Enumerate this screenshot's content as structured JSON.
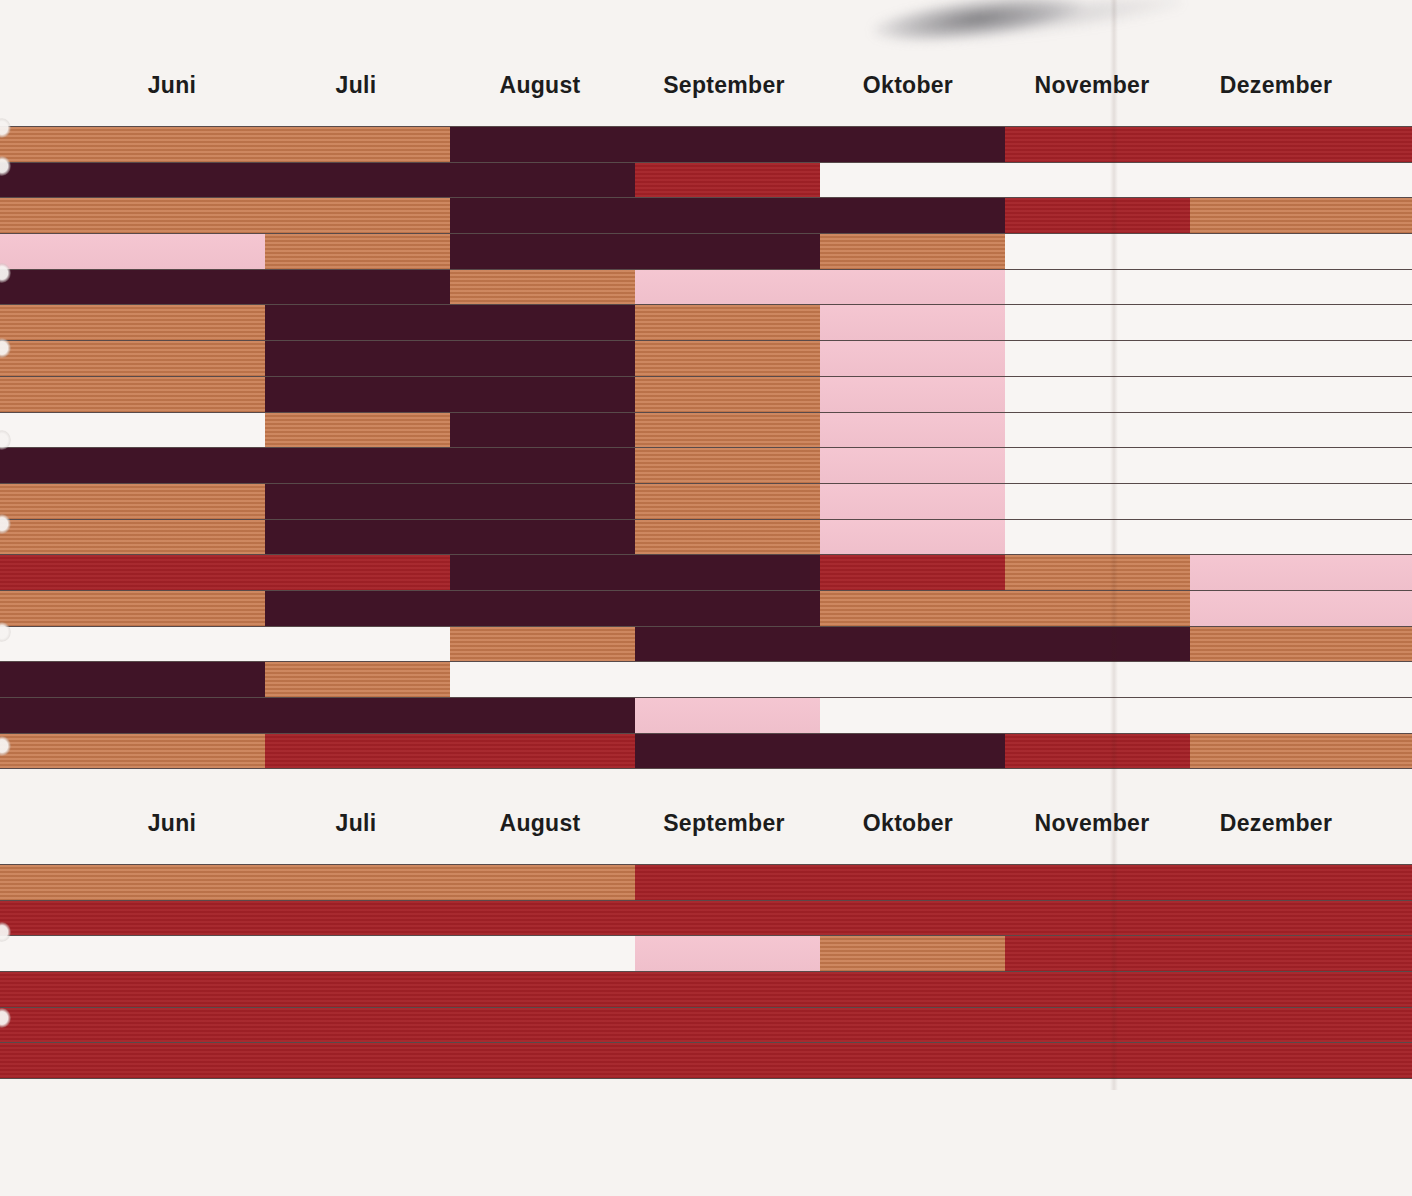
{
  "chart_data": {
    "type": "heatmap",
    "subtype": "seasonal-timeline-bars",
    "x_categories": [
      "Juni",
      "Juli",
      "August",
      "September",
      "Oktober",
      "November",
      "Dezember"
    ],
    "legend_position": "none",
    "grid": "row-separator-lines",
    "colors": {
      "o": "#c87a4e",
      "d": "#401427",
      "r": "#a42127",
      "p": "#f4c3cf",
      "w": "#f8f5f3"
    },
    "color_names": {
      "o": "orange",
      "d": "dark-maroon",
      "r": "red",
      "p": "pink",
      "w": "white"
    },
    "panels": [
      {
        "rows": [
          [
            {
              "c": "o",
              "w": 31.9
            },
            {
              "c": "d",
              "w": 39.3
            },
            {
              "c": "r",
              "w": 28.8
            }
          ],
          [
            {
              "c": "d",
              "w": 45.0
            },
            {
              "c": "r",
              "w": 13.1
            },
            {
              "c": "w",
              "w": 41.9
            }
          ],
          [
            {
              "c": "o",
              "w": 31.9
            },
            {
              "c": "d",
              "w": 39.3
            },
            {
              "c": "r",
              "w": 13.1
            },
            {
              "c": "o",
              "w": 15.7
            }
          ],
          [
            {
              "c": "p",
              "w": 18.8
            },
            {
              "c": "o",
              "w": 13.1
            },
            {
              "c": "d",
              "w": 26.2
            },
            {
              "c": "o",
              "w": 13.1
            },
            {
              "c": "w",
              "w": 28.8
            }
          ],
          [
            {
              "c": "d",
              "w": 31.9
            },
            {
              "c": "o",
              "w": 13.1
            },
            {
              "c": "p",
              "w": 26.2
            },
            {
              "c": "w",
              "w": 28.8
            }
          ],
          [
            {
              "c": "o",
              "w": 18.8
            },
            {
              "c": "d",
              "w": 26.2
            },
            {
              "c": "o",
              "w": 13.1
            },
            {
              "c": "p",
              "w": 13.1
            },
            {
              "c": "w",
              "w": 28.8
            }
          ],
          [
            {
              "c": "o",
              "w": 18.8
            },
            {
              "c": "d",
              "w": 26.2
            },
            {
              "c": "o",
              "w": 13.1
            },
            {
              "c": "p",
              "w": 13.1
            },
            {
              "c": "w",
              "w": 28.8
            }
          ],
          [
            {
              "c": "o",
              "w": 18.8
            },
            {
              "c": "d",
              "w": 26.2
            },
            {
              "c": "o",
              "w": 13.1
            },
            {
              "c": "p",
              "w": 13.1
            },
            {
              "c": "w",
              "w": 28.8
            }
          ],
          [
            {
              "c": "w",
              "w": 18.8
            },
            {
              "c": "o",
              "w": 13.1
            },
            {
              "c": "d",
              "w": 13.1
            },
            {
              "c": "o",
              "w": 13.1
            },
            {
              "c": "p",
              "w": 13.1
            },
            {
              "c": "w",
              "w": 28.8
            }
          ],
          [
            {
              "c": "d",
              "w": 45.0
            },
            {
              "c": "o",
              "w": 13.1
            },
            {
              "c": "p",
              "w": 13.1
            },
            {
              "c": "w",
              "w": 28.8
            }
          ],
          [
            {
              "c": "o",
              "w": 18.8
            },
            {
              "c": "d",
              "w": 26.2
            },
            {
              "c": "o",
              "w": 13.1
            },
            {
              "c": "p",
              "w": 13.1
            },
            {
              "c": "w",
              "w": 28.8
            }
          ],
          [
            {
              "c": "o",
              "w": 18.8
            },
            {
              "c": "d",
              "w": 26.2
            },
            {
              "c": "o",
              "w": 13.1
            },
            {
              "c": "p",
              "w": 13.1
            },
            {
              "c": "w",
              "w": 28.8
            }
          ],
          [
            {
              "c": "r",
              "w": 31.9
            },
            {
              "c": "d",
              "w": 26.2
            },
            {
              "c": "r",
              "w": 13.1
            },
            {
              "c": "o",
              "w": 13.1
            },
            {
              "c": "p",
              "w": 15.7
            }
          ],
          [
            {
              "c": "o",
              "w": 18.8
            },
            {
              "c": "d",
              "w": 39.3
            },
            {
              "c": "o",
              "w": 26.2
            },
            {
              "c": "p",
              "w": 15.7
            }
          ],
          [
            {
              "c": "w",
              "w": 31.9
            },
            {
              "c": "o",
              "w": 13.1
            },
            {
              "c": "d",
              "w": 39.3
            },
            {
              "c": "o",
              "w": 15.7
            }
          ],
          [
            {
              "c": "d",
              "w": 18.8
            },
            {
              "c": "o",
              "w": 13.1
            },
            {
              "c": "w",
              "w": 68.1
            }
          ],
          [
            {
              "c": "d",
              "w": 45.0
            },
            {
              "c": "p",
              "w": 13.1
            },
            {
              "c": "w",
              "w": 41.9
            }
          ],
          [
            {
              "c": "o",
              "w": 18.8
            },
            {
              "c": "r",
              "w": 26.2
            },
            {
              "c": "d",
              "w": 26.2
            },
            {
              "c": "r",
              "w": 13.1
            },
            {
              "c": "o",
              "w": 15.7
            }
          ]
        ]
      },
      {
        "rows": [
          [
            {
              "c": "o",
              "w": 45.0
            },
            {
              "c": "r",
              "w": 55.0
            }
          ],
          [
            {
              "c": "r",
              "w": 100
            }
          ],
          [
            {
              "c": "w",
              "w": 45.0
            },
            {
              "c": "p",
              "w": 13.1
            },
            {
              "c": "o",
              "w": 13.1
            },
            {
              "c": "r",
              "w": 28.8
            }
          ],
          [
            {
              "c": "r",
              "w": 100
            }
          ],
          [
            {
              "c": "r",
              "w": 100
            }
          ],
          [
            {
              "c": "r",
              "w": 100
            }
          ]
        ]
      }
    ]
  }
}
